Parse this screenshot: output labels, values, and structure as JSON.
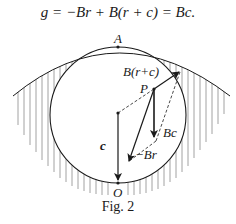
{
  "equation": {
    "text": "g = −Br + B(r + c) = Bc."
  },
  "figure": {
    "caption": "Fig. 2",
    "points": {
      "A": "A",
      "P": "P",
      "O": "O"
    },
    "vectors": {
      "c": "c",
      "Bc": "Bc",
      "neg_Br": "−Br",
      "B_r_plus_c": "B(r+c)"
    },
    "colors": {
      "ink": "#1a1a1a",
      "hatch": "#8a8a8a",
      "background": "#ffffff"
    }
  }
}
